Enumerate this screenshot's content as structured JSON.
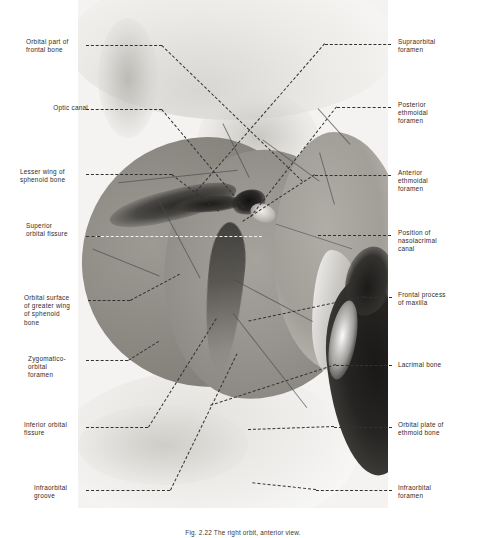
{
  "figure": {
    "kind": "anatomical-photograph",
    "subject": "right orbit, anterior view",
    "caption": "Fig. 2.22  The right orbit, anterior view.",
    "photo": {
      "tone": "black-and-white halftone photograph",
      "bg_hex": "#f4f3f1",
      "bone_mid_hex": "#9a9791",
      "cavity_dark_hex": "#1b1a18",
      "highlight_hex": "#fbfbfa"
    },
    "leader_line": {
      "style": "dashed",
      "color_hex": "#343230",
      "color_on_dark_hex": "#f2f1ee"
    }
  },
  "labels_left": [
    {
      "id": "orbital-part-of-frontal-bone",
      "text": "Orbital part of\nfrontal bone"
    },
    {
      "id": "optic-canal",
      "text": "Optic canal"
    },
    {
      "id": "lesser-wing-of-sphenoid-bone",
      "text": "Lesser wing of\nsphenoid bone"
    },
    {
      "id": "superior-orbital-fissure",
      "text": "Superior\norbital fissure"
    },
    {
      "id": "orbital-surface-of-greater-wing-of-sphenoid-bone",
      "text": "Orbital surface\nof greater wing\nof sphenoid\nbone"
    },
    {
      "id": "zygomatico-orbital-foramen",
      "text": "Zygomatico-\norbital\nforamen"
    },
    {
      "id": "inferior-orbital-fissure",
      "text": "Inferior orbital\nfissure"
    },
    {
      "id": "infraorbital-groove",
      "text": "Infraorbital\ngroove"
    }
  ],
  "labels_right": [
    {
      "id": "supraorbital-foramen",
      "text": "Supraorbital\nforamen"
    },
    {
      "id": "posterior-ethmoidal-foramen",
      "text": "Posterior\nethmoidal\nforamen"
    },
    {
      "id": "anterior-ethmoidal-foramen",
      "text": "Anterior\nethmoidal\nforamen"
    },
    {
      "id": "position-of-nasolacrimal-canal",
      "text": "Position of\nnasolacrimal\ncanal"
    },
    {
      "id": "frontal-process-of-maxilla",
      "text": "Frontal process\nof maxilla"
    },
    {
      "id": "lacrimal-bone",
      "text": "Lacrimal bone"
    },
    {
      "id": "orbital-plate-of-ethmoid-bone",
      "text": "Orbital plate of\nethmoid bone"
    },
    {
      "id": "infraorbital-foramen",
      "text": "Infraorbital\nforamen"
    }
  ]
}
